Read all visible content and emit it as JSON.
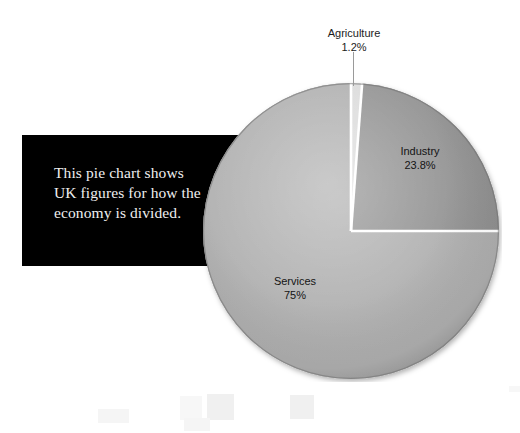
{
  "chart_data": {
    "type": "pie",
    "title": "",
    "subtitle": "",
    "categories": [
      "Agriculture",
      "Industry",
      "Services"
    ],
    "values": [
      1.2,
      23.8,
      75
    ],
    "value_labels": [
      "1.2%",
      "23.8%",
      "75%"
    ],
    "units": "percent",
    "total": 100,
    "start_angle_deg": 0,
    "direction": "clockwise",
    "legend": "none",
    "labels_position": "on-slice-and-callout",
    "slices": [
      {
        "name": "Agriculture",
        "value": 1.2,
        "value_label": "1.2%",
        "color": "#d9d9d9",
        "label_placement": "callout-above",
        "has_leader_line": true
      },
      {
        "name": "Industry",
        "value": 23.8,
        "value_label": "23.8%",
        "color": "#8c8c8c",
        "label_placement": "inside",
        "has_leader_line": false
      },
      {
        "name": "Services",
        "value": 75,
        "value_label": "75%",
        "color": "#ababab",
        "label_placement": "inside",
        "has_leader_line": false
      }
    ]
  },
  "caption": {
    "text": "This pie chart shows\nUK figures for how the\neconomy is divided.",
    "background_color": "#000000",
    "text_color": "#efefef"
  },
  "canvas": {
    "background_color": "#ffffff",
    "separator_color": "#ffffff",
    "label_color": "#1c1c1c",
    "leader_line_color": "#9a9a9a"
  },
  "decorations": {
    "squares": [
      {
        "x": 98,
        "y": 409,
        "w": 31,
        "h": 14,
        "tone": "lighter"
      },
      {
        "x": 180,
        "y": 396,
        "w": 22,
        "h": 24,
        "tone": "faint"
      },
      {
        "x": 207,
        "y": 394,
        "w": 27,
        "h": 26,
        "tone": "normal"
      },
      {
        "x": 184,
        "y": 418,
        "w": 26,
        "h": 13,
        "tone": "lighter"
      },
      {
        "x": 290,
        "y": 395,
        "w": 24,
        "h": 24,
        "tone": "normal"
      },
      {
        "x": 509,
        "y": 386,
        "w": 11,
        "h": 6,
        "tone": "faint"
      }
    ]
  }
}
